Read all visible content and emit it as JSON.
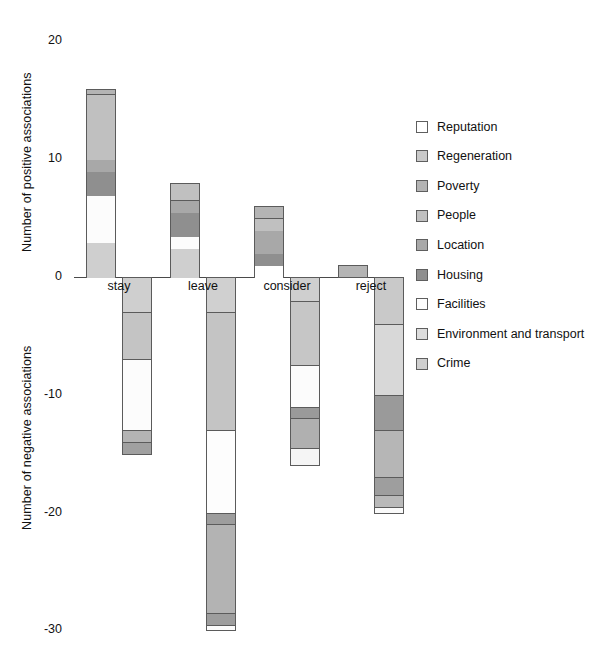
{
  "chart_data": {
    "type": "bar",
    "title": "",
    "subtype": "stacked-bar-diverging",
    "categories": [
      "stay",
      "leave",
      "consider",
      "reject"
    ],
    "xlabel": "",
    "ylabel_positive": "Number of positive associations",
    "ylabel_negative": "Number of negative associations",
    "ylim": [
      -30,
      20
    ],
    "yticks": [
      20,
      10,
      0,
      -10,
      -20,
      -30
    ],
    "ytick_labels": [
      "20",
      "10",
      "0",
      "-10",
      "-20",
      "-30"
    ],
    "grid": false,
    "legend_position": "right",
    "legend": [
      {
        "name": "Reputation",
        "color": "#ffffff"
      },
      {
        "name": "Regeneration",
        "color": "#c9c9c9"
      },
      {
        "name": "Poverty",
        "color": "#b4b4b4"
      },
      {
        "name": "People",
        "color": "#c0c0c0"
      },
      {
        "name": "Location",
        "color": "#a8a8a8"
      },
      {
        "name": "Housing",
        "color": "#8f8f8f"
      },
      {
        "name": "Facilities",
        "color": "#fcfcfc"
      },
      {
        "name": "Environment and transport",
        "color": "#dcdcdc"
      },
      {
        "name": "Crime",
        "color": "#cfcfcf"
      }
    ],
    "positive_series": [
      {
        "category": "stay",
        "total": 16,
        "segments": [
          {
            "name": "Crime",
            "value": 3,
            "color": "#cfcfcf"
          },
          {
            "name": "Facilities",
            "value": 4,
            "color": "#fcfcfc"
          },
          {
            "name": "Housing",
            "value": 2,
            "color": "#8f8f8f"
          },
          {
            "name": "Location",
            "value": 1,
            "color": "#a8a8a8"
          },
          {
            "name": "People",
            "value": 5.5,
            "color": "#c0c0c0"
          },
          {
            "name": "Poverty",
            "value": 0.5,
            "color": "#b4b4b4"
          }
        ]
      },
      {
        "category": "leave",
        "total": 8,
        "segments": [
          {
            "name": "Crime",
            "value": 2.5,
            "color": "#cfcfcf"
          },
          {
            "name": "Facilities",
            "value": 1,
            "color": "#fcfcfc"
          },
          {
            "name": "Housing",
            "value": 2,
            "color": "#8f8f8f"
          },
          {
            "name": "Location",
            "value": 1,
            "color": "#a8a8a8"
          },
          {
            "name": "People",
            "value": 1.5,
            "color": "#c0c0c0"
          }
        ]
      },
      {
        "category": "consider",
        "total": 6,
        "segments": [
          {
            "name": "Reputation",
            "value": 1,
            "color": "#ffffff"
          },
          {
            "name": "Housing",
            "value": 1,
            "color": "#8f8f8f"
          },
          {
            "name": "Location",
            "value": 2,
            "color": "#a8a8a8"
          },
          {
            "name": "People",
            "value": 1,
            "color": "#c0c0c0"
          },
          {
            "name": "Poverty",
            "value": 1,
            "color": "#b4b4b4"
          }
        ]
      },
      {
        "category": "reject",
        "total": 1,
        "segments": [
          {
            "name": "People",
            "value": 1,
            "color": "#b4b4b4"
          }
        ]
      }
    ],
    "negative_series": [
      {
        "category": "stay",
        "total": -15,
        "segments": [
          {
            "name": "Environment and transport",
            "value": 3,
            "color": "#cfcfcf"
          },
          {
            "name": "Regeneration",
            "value": 4,
            "color": "#c4c4c4"
          },
          {
            "name": "Facilities",
            "value": 6,
            "color": "#fcfcfc"
          },
          {
            "name": "Poverty",
            "value": 1,
            "color": "#b4b4b4"
          },
          {
            "name": "Housing",
            "value": 1,
            "color": "#a0a0a0"
          }
        ]
      },
      {
        "category": "leave",
        "total": -30,
        "segments": [
          {
            "name": "Environment and transport",
            "value": 3,
            "color": "#d0d0d0"
          },
          {
            "name": "Regeneration",
            "value": 10,
            "color": "#c4c4c4"
          },
          {
            "name": "Facilities",
            "value": 7,
            "color": "#fdfdfd"
          },
          {
            "name": "Poverty",
            "value": 1,
            "color": "#9d9d9d"
          },
          {
            "name": "People",
            "value": 7.5,
            "color": "#b3b3b3"
          },
          {
            "name": "Location",
            "value": 1,
            "color": "#9d9d9d"
          },
          {
            "name": "Reputation",
            "value": 0.5,
            "color": "#fbfbfb"
          }
        ]
      },
      {
        "category": "consider",
        "total": -16,
        "segments": [
          {
            "name": "Environment and transport",
            "value": 2,
            "color": "#cfcfcf"
          },
          {
            "name": "Regeneration",
            "value": 5.5,
            "color": "#c6c6c6"
          },
          {
            "name": "Facilities",
            "value": 3.5,
            "color": "#fcfcfc"
          },
          {
            "name": "Housing",
            "value": 1,
            "color": "#9a9a9a"
          },
          {
            "name": "People",
            "value": 2.5,
            "color": "#b0b0b0"
          },
          {
            "name": "Reputation",
            "value": 1.5,
            "color": "#f5f5f5"
          }
        ]
      },
      {
        "category": "reject",
        "total": -20,
        "segments": [
          {
            "name": "Environment and transport",
            "value": 4,
            "color": "#c9c9c9"
          },
          {
            "name": "Regeneration",
            "value": 6,
            "color": "#d8d8d8"
          },
          {
            "name": "Housing",
            "value": 3,
            "color": "#9a9a9a"
          },
          {
            "name": "People",
            "value": 4,
            "color": "#b6b6b6"
          },
          {
            "name": "Location",
            "value": 1.5,
            "color": "#9e9e9e"
          },
          {
            "name": "Poverty",
            "value": 1,
            "color": "#b9b9b9"
          },
          {
            "name": "Reputation",
            "value": 0.5,
            "color": "#fafafa"
          }
        ]
      }
    ]
  },
  "footnote": ""
}
